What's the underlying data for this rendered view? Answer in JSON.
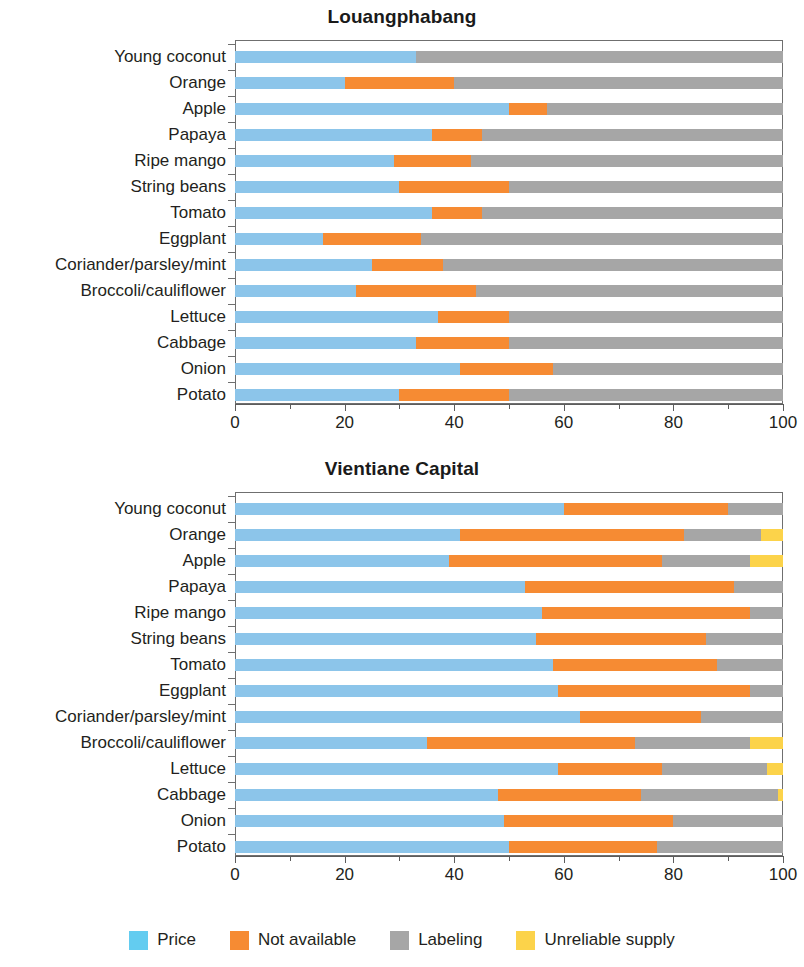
{
  "figure": {
    "categories": [
      "Young coconut",
      "Orange",
      "Apple",
      "Papaya",
      "Ripe mango",
      "String beans",
      "Tomato",
      "Eggplant",
      "Coriander/parsley/mint",
      "Broccoli/cauliflower",
      "Lettuce",
      "Cabbage",
      "Onion",
      "Potato"
    ],
    "x_ticks": [
      0,
      20,
      40,
      60,
      80,
      100
    ],
    "x_tick_labels": [
      "0",
      "20",
      "40",
      "60",
      "80",
      "100"
    ],
    "minor_ticks": [
      10,
      30,
      50,
      70,
      90
    ],
    "xlim": [
      0,
      100
    ]
  },
  "legend": {
    "position": "bottom-center",
    "items": [
      {
        "label": "Price",
        "color": "#63ccf0"
      },
      {
        "label": "Not available",
        "color": "#f68b33"
      },
      {
        "label": "Labeling",
        "color": "#a6a6a6"
      },
      {
        "label": "Unreliable supply",
        "color": "#fcd залив"
      }
    ]
  },
  "chart_data": [
    {
      "type": "bar",
      "orientation": "horizontal",
      "stacked": true,
      "percent": true,
      "title": "Louangphabang",
      "xlabel": "",
      "ylabel": "",
      "xlim": [
        0,
        100
      ],
      "grid": false,
      "categories": [
        "Young coconut",
        "Orange",
        "Apple",
        "Papaya",
        "Ripe mango",
        "String beans",
        "Tomato",
        "Eggplant",
        "Coriander/parsley/mint",
        "Broccoli/cauliflower",
        "Lettuce",
        "Cabbage",
        "Onion",
        "Potato"
      ],
      "series": [
        {
          "name": "Price",
          "color": "#8cc5ea",
          "values": [
            33,
            20,
            50,
            36,
            29,
            30,
            36,
            16,
            25,
            22,
            37,
            33,
            41,
            30
          ]
        },
        {
          "name": "Not available",
          "color": "#f68b33",
          "values": [
            0,
            20,
            7,
            9,
            14,
            20,
            9,
            18,
            13,
            22,
            13,
            17,
            17,
            20
          ]
        },
        {
          "name": "Labeling",
          "color": "#a6a6a6",
          "values": [
            67,
            60,
            43,
            55,
            57,
            50,
            55,
            66,
            62,
            56,
            50,
            50,
            42,
            50
          ]
        },
        {
          "name": "Unreliable supply",
          "color": "#fcd34a",
          "values": [
            0,
            0,
            0,
            0,
            0,
            0,
            0,
            0,
            0,
            0,
            0,
            0,
            0,
            0
          ]
        }
      ]
    },
    {
      "type": "bar",
      "orientation": "horizontal",
      "stacked": true,
      "percent": true,
      "title": "Vientiane Capital",
      "xlabel": "",
      "ylabel": "",
      "xlim": [
        0,
        100
      ],
      "grid": false,
      "categories": [
        "Young coconut",
        "Orange",
        "Apple",
        "Papaya",
        "Ripe mango",
        "String beans",
        "Tomato",
        "Eggplant",
        "Coriander/parsley/mint",
        "Broccoli/cauliflower",
        "Lettuce",
        "Cabbage",
        "Onion",
        "Potato"
      ],
      "series": [
        {
          "name": "Price",
          "color": "#8cc5ea",
          "values": [
            60,
            41,
            39,
            53,
            56,
            55,
            58,
            59,
            63,
            35,
            59,
            48,
            49,
            50
          ]
        },
        {
          "name": "Not available",
          "color": "#f68b33",
          "values": [
            30,
            41,
            39,
            38,
            38,
            31,
            30,
            35,
            22,
            38,
            19,
            26,
            31,
            27
          ]
        },
        {
          "name": "Labeling",
          "color": "#a6a6a6",
          "values": [
            10,
            14,
            16,
            9,
            6,
            14,
            12,
            6,
            15,
            21,
            19,
            25,
            20,
            23
          ]
        },
        {
          "name": "Unreliable supply",
          "color": "#fcd34a",
          "values": [
            0,
            4,
            6,
            0,
            0,
            0,
            0,
            0,
            0,
            6,
            3,
            1,
            0,
            0
          ]
        }
      ]
    }
  ]
}
